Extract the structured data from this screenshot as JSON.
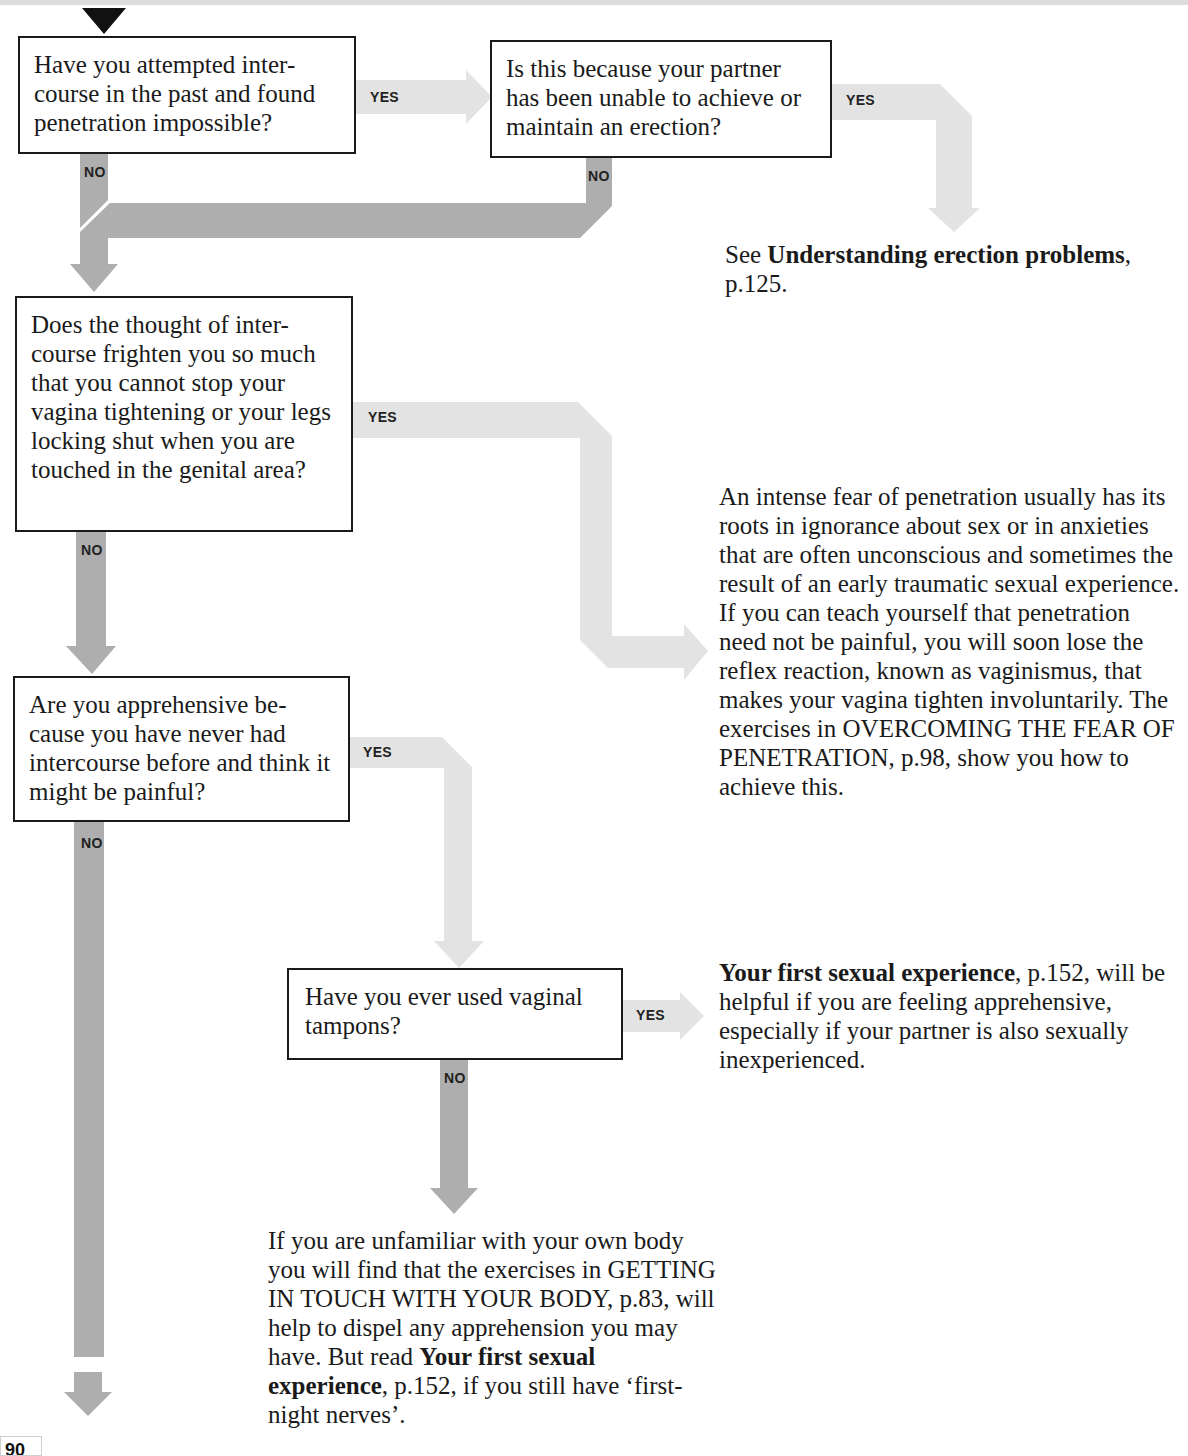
{
  "flowchart": {
    "questions": [
      {
        "id": "q1",
        "text": "Have you attempted inter-course in the past and found penetration impossible?"
      },
      {
        "id": "q2",
        "text": "Is this because your partner has been unable to achieve or maintain an erection?"
      },
      {
        "id": "q3",
        "text": "Does the thought of inter-course frighten you so much that you cannot stop your vagina tightening or your legs locking shut when you are touched in the genital area?"
      },
      {
        "id": "q4",
        "text": "Are you apprehensive be-cause you have never had intercourse before and think it might be painful?"
      },
      {
        "id": "q5",
        "text": "Have you ever used vaginal tampons?"
      }
    ],
    "labels": {
      "yes": "YES",
      "no": "NO"
    },
    "answers": {
      "a1": {
        "prefix": "See ",
        "bold": "Understanding erection problems",
        "suffix": ", p.125."
      },
      "a2": {
        "text": "An intense fear of penetration usually has its roots in ignorance about sex or in anxieties that are often unconscious and sometimes the result of an early traumatic sexual experience. If you can teach yourself that penetration need not be painful, you will soon lose the reflex reaction, known as vaginismus, that makes your vagina tighten involuntarily. The exercises in OVERCOMING THE FEAR OF PENETRATION, p.98, show you how to achieve this."
      },
      "a3": {
        "bold": "Your first sexual experience",
        "suffix": ", p.152, will be helpful if you are feeling apprehensive, especially if your partner is also sexually inexperienced."
      },
      "a4": {
        "text": "If you are unfamiliar with your own body you will find that the exercises in GETTING IN TOUCH WITH YOUR BODY, p.83, will help to dispel any apprehension you may have. But read ",
        "bold": "Your first sexual experience",
        "suffix": ", p.152, if you still have ‘first-night nerves’."
      }
    }
  },
  "page": {
    "number": "90"
  },
  "colors": {
    "yes_arrow": "#e3e3e3",
    "no_arrow": "#aeaeae",
    "box_border": "#1a1a1a",
    "start_marker": "#111111"
  }
}
